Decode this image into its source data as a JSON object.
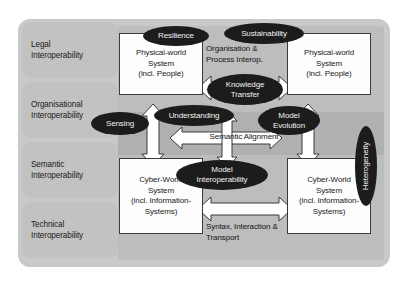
{
  "diagram": {
    "colors": {
      "frame": "#c9c9c9",
      "band": "#c2c2c2",
      "plate": "#bdbdbd",
      "mid_band": "#b0b0b0",
      "box_fill": "#fdfdfd",
      "box_stroke": "#3a3a3a",
      "bubble_fill": "#1c1c1c",
      "bubble_text": "#f2f2f2",
      "text": "#1b1b1b"
    }
  },
  "layers": [
    {
      "id": "legal",
      "label": "Legal\nInteroperability"
    },
    {
      "id": "organisational",
      "label": "Organisational\nInteroperability"
    },
    {
      "id": "semantic",
      "label": "Semantic\nInteroperability"
    },
    {
      "id": "technical",
      "label": "Technical\nInteroperability"
    }
  ],
  "systems": [
    {
      "id": "physical-left",
      "label": "Physical-world\nSystem\n(incl. People)"
    },
    {
      "id": "physical-right",
      "label": "Physical-world\nSystem\n(incl. People)"
    },
    {
      "id": "cyber-left",
      "label": "Cyber-World\nSystem\n(incl. Information-\nSystems)"
    },
    {
      "id": "cyber-right",
      "label": "Cyber-World\nSystem\n(incl. Information-\nSystems)"
    }
  ],
  "connectors": [
    {
      "id": "organisation-process-interop",
      "label": "Organisation &\nProcess Interop."
    },
    {
      "id": "semantic-alignment",
      "label": "Semantic Alignment"
    },
    {
      "id": "syntax-interaction-transport",
      "label": "Syntax, Interaction &\nTransport"
    }
  ],
  "bubbles": [
    {
      "id": "resilience",
      "label": "Resilience"
    },
    {
      "id": "sustainability",
      "label": "Sustainability"
    },
    {
      "id": "knowledge-transfer",
      "label": "Knowledge\nTransfer"
    },
    {
      "id": "sensing",
      "label": "Sensing"
    },
    {
      "id": "understanding",
      "label": "Understanding"
    },
    {
      "id": "model-evolution",
      "label": "Model\nEvolution"
    },
    {
      "id": "model-interoperability",
      "label": "Model\nInteroperability"
    },
    {
      "id": "heterogeneity",
      "label": "Heterogeneity"
    }
  ]
}
